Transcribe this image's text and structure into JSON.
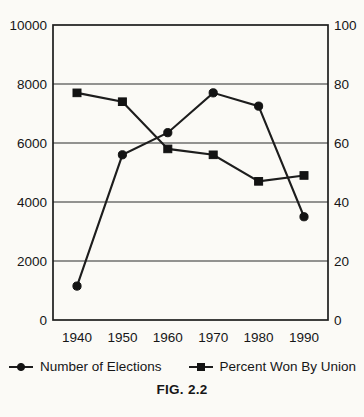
{
  "chart_data": {
    "type": "line",
    "title": "",
    "caption": "FIG. 2.2",
    "categories": [
      "1940",
      "1950",
      "1960",
      "1970",
      "1980",
      "1990"
    ],
    "series": [
      {
        "name": "Number of Elections",
        "axis": "left",
        "marker": "circle",
        "values": [
          1150,
          5600,
          6350,
          7700,
          7250,
          3500
        ]
      },
      {
        "name": "Percent Won By Union",
        "axis": "right",
        "marker": "square",
        "values": [
          77,
          74,
          58,
          56,
          47,
          49
        ]
      }
    ],
    "axes": {
      "left": {
        "min": 0,
        "max": 10000,
        "ticks": [
          0,
          2000,
          4000,
          6000,
          8000,
          10000
        ],
        "tick_labels": [
          "0",
          "2000",
          "4000",
          "6000",
          "8000",
          "10000"
        ]
      },
      "right": {
        "min": 0,
        "max": 100,
        "ticks": [
          0,
          20,
          40,
          60,
          80,
          100
        ],
        "tick_labels": [
          "0",
          "20",
          "40",
          "60",
          "80",
          "100"
        ]
      },
      "x": {
        "labels": [
          "1940",
          "1950",
          "1960",
          "1970",
          "1980",
          "1990"
        ]
      }
    },
    "grid": "horizontal",
    "legend_position": "bottom",
    "colors": {
      "line": "#1d1d1d",
      "marker": "#131313",
      "background": "#fbfaf6",
      "text": "#161616"
    }
  }
}
